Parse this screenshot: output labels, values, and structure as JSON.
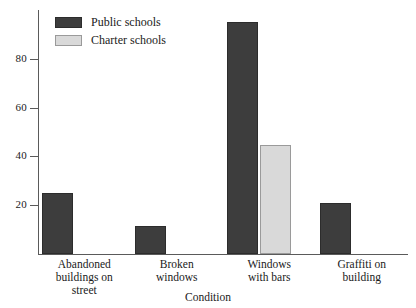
{
  "chart_data": {
    "type": "bar",
    "title": "",
    "xlabel": "Condition",
    "ylabel": "",
    "categories": [
      "Abandoned buildings on street",
      "Broken windows",
      "Windows with bars",
      "Graffiti on building"
    ],
    "category_lines": [
      [
        "Abandoned",
        "buildings on",
        "street"
      ],
      [
        "Broken",
        "windows"
      ],
      [
        "Windows",
        "with bars"
      ],
      [
        "Graffiti on",
        "building"
      ]
    ],
    "series": [
      {
        "name": "Public schools",
        "values": [
          25,
          11.5,
          95,
          21
        ]
      },
      {
        "name": "Charter schools",
        "values": [
          null,
          null,
          44.5,
          null
        ]
      }
    ],
    "ylim": [
      0,
      100
    ],
    "yticks": [
      20,
      40,
      60,
      80
    ],
    "ytick_labels": [
      "20",
      "40",
      "60",
      "80"
    ],
    "grid": false,
    "legend_position": "top-left",
    "colors": {
      "public": "#3d3d3d",
      "charter": "#d9d9d9",
      "axis": "#5a5a5a",
      "text": "#1a1a1a",
      "background": "#ffffff"
    }
  },
  "legend": {
    "entries": [
      {
        "label": "Public schools",
        "swatch": "dark-swatch-icon"
      },
      {
        "label": "Charter schools",
        "swatch": "light-swatch-icon"
      }
    ]
  }
}
